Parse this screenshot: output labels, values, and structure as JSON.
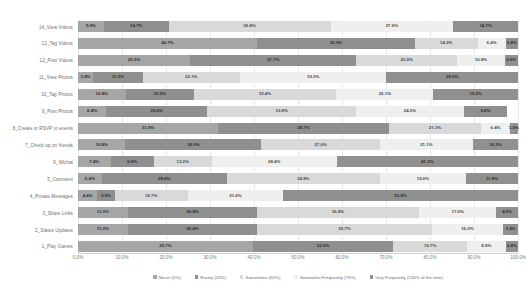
{
  "chart_data": {
    "type": "bar",
    "title": "",
    "subtitle": "",
    "xlabel": "",
    "ylabel": "",
    "orientation": "horizontal",
    "stacked": true,
    "stack_mode": "percent",
    "xlim": [
      0,
      100
    ],
    "grid": true,
    "legend_position": "bottom",
    "xticks": [
      "0.0%",
      "10.0%",
      "20.0%",
      "30.0%",
      "40.0%",
      "50.0%",
      "60.0%",
      "70.0%",
      "80.0%",
      "90.0%",
      "100.0%"
    ],
    "xtick_values": [
      0,
      10,
      20,
      30,
      40,
      50,
      60,
      70,
      80,
      90,
      100
    ],
    "categories": [
      "14_View Videos",
      "13_Tag Videos",
      "12_Post Videos",
      "11_View Photos",
      "10_Tag Photos",
      "9_Post Photos",
      "8_Create or RSVP to events",
      "7_Check up on friends",
      "6_IMchat",
      "5_Comment",
      "4_Private Messages",
      "3_Share Links",
      "2_Status Updates",
      "1_Play Games"
    ],
    "series": [
      {
        "name": "Never (0%)",
        "color": "#a6a6a6",
        "values": [
          5.9,
          40.7,
          25.5,
          3.4,
          10.8,
          6.4,
          31.9,
          10.8,
          7.4,
          5.4,
          4.4,
          11.3,
          11.3,
          39.7
        ]
      },
      {
        "name": "Rarely  (25%)",
        "color": "#8f8f8f",
        "values": [
          14.7,
          35.9,
          37.7,
          11.3,
          15.5,
          23.0,
          38.7,
          30.9,
          9.8,
          28.4,
          3.9,
          29.4,
          29.4,
          32.0
        ]
      },
      {
        "name": "Sometimes  (50%)",
        "color": "#d9d9d9",
        "values": [
          36.8,
          14.2,
          23.0,
          22.1,
          32.4,
          33.8,
          21.1,
          27.0,
          13.2,
          34.8,
          16.7,
          36.8,
          39.7,
          16.7
        ]
      },
      {
        "name": "Somewhat Frequently (75%)",
        "color": "#efefef",
        "values": [
          27.9,
          6.4,
          10.8,
          33.3,
          22.1,
          24.5,
          6.4,
          21.1,
          28.4,
          19.6,
          21.6,
          17.6,
          16.2,
          8.8
        ]
      },
      {
        "name": "Very Frequently (100% of the time)",
        "color": "#909090",
        "values": [
          14.7,
          2.8,
          2.9,
          29.9,
          19.2,
          9.8,
          1.9,
          10.3,
          41.2,
          11.8,
          53.4,
          4.9,
          3.4,
          2.8
        ]
      }
    ],
    "value_labels": [
      [
        "5.9%",
        "14.7%",
        "36.8%",
        "27.9%",
        "14.7%"
      ],
      [
        "40.7%",
        "35.9%",
        "14.2%",
        "6.4%",
        "2.8%"
      ],
      [
        "25.5%",
        "37.7%",
        "23.0%",
        "10.8%",
        "2.9%"
      ],
      [
        "3.4%",
        "11.3%",
        "22.1%",
        "33.3%",
        "29.9%"
      ],
      [
        "10.8%",
        "15.5%",
        "32.4%",
        "22.1%",
        "19.2%"
      ],
      [
        "6.4%",
        "23.0%",
        "33.8%",
        "24.5%",
        "9.8%"
      ],
      [
        "31.9%",
        "38.7%",
        "21.1%",
        "6.4%",
        "1.9%"
      ],
      [
        "10.8%",
        "30.9%",
        "27.0%",
        "21.1%",
        "10.3%"
      ],
      [
        "7.4%",
        "9.8%",
        "13.2%",
        "28.4%",
        "41.2%"
      ],
      [
        "5.4%",
        "28.4%",
        "34.8%",
        "19.6%",
        "11.8%"
      ],
      [
        "4.4%",
        "3.9%",
        "16.7%",
        "21.6%",
        "53.4%"
      ],
      [
        "11.3%",
        "29.4%",
        "36.8%",
        "17.6%",
        "4.9%"
      ],
      [
        "11.3%",
        "29.4%",
        "39.7%",
        "16.2%",
        "3.4%"
      ],
      [
        "39.7%",
        "32.0%",
        "16.7%",
        "8.8%",
        "2.8%"
      ]
    ]
  }
}
